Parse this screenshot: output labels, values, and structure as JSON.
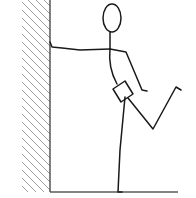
{
  "figure": {
    "colors": {
      "background": "#ffffff",
      "line": "#1a1a1a",
      "hatch": "#8a8a8a",
      "wall": "#4a4a4a",
      "floor": "#5a5a5a"
    },
    "wall": {
      "x": 50,
      "top": 0,
      "bottom": 192,
      "hatch_left": 22
    },
    "floor": {
      "y": 192,
      "x1": 50,
      "x2": 178
    },
    "head": {
      "cx": 112,
      "cy": 18,
      "rx": 9,
      "ry": 14
    }
  }
}
